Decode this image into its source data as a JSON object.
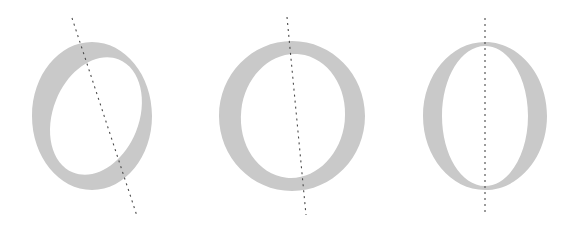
{
  "figure": {
    "background_color": "#ffffff",
    "width": 569,
    "height": 234,
    "glyph_color": "#c9c9c9",
    "axis_color": "#4a4a4a",
    "margin_guide_color": "#f4f4f4",
    "dash_pattern": "2 4",
    "axis_stroke_width": 1.1
  },
  "margin_guide": {
    "name": "left-margin-guide",
    "x": 10,
    "y_top": 8,
    "y_bottom": 228,
    "dash_pattern": "2 4",
    "color": "#f4f4f4"
  },
  "specimens": [
    {
      "id": "specimen-1",
      "letter": "O",
      "style_name": "Old Style",
      "stress": "oblique",
      "stress_angle_degrees": 22,
      "left_px": 0,
      "width_px": 190,
      "glyph": {
        "center_x": 92,
        "center_y": 116,
        "outer_rx": 60,
        "outer_ry": 74,
        "inner_rx": 43,
        "inner_ry": 61,
        "inner_offset_x": 4,
        "inner_rotation_degrees": 22,
        "bbox": {
          "x1": 32,
          "y1": 42,
          "x2": 152,
          "y2": 190
        }
      },
      "axis_line": {
        "name": "stress-axis-line",
        "x1": 72,
        "y1": 18,
        "x2": 137,
        "y2": 216
      }
    },
    {
      "id": "specimen-2",
      "letter": "O",
      "style_name": "Transitional",
      "stress": "slightly inclined",
      "stress_angle_degrees": 6,
      "left_px": 190,
      "width_px": 190,
      "glyph": {
        "center_x": 102,
        "center_y": 116,
        "outer_rx": 73,
        "outer_ry": 75,
        "inner_rx": 52,
        "inner_ry": 62,
        "inner_offset_x": 1,
        "inner_rotation_degrees": 6,
        "bbox": {
          "x1": 220,
          "y1": 41,
          "x2": 365,
          "y2": 190
        }
      },
      "axis_line": {
        "name": "stress-axis-line",
        "x1": 287,
        "y1": 17,
        "x2": 306,
        "y2": 215
      }
    },
    {
      "id": "specimen-3",
      "letter": "O",
      "style_name": "Didone",
      "stress": "vertical",
      "stress_angle_degrees": 0,
      "left_px": 380,
      "width_px": 189,
      "glyph": {
        "center_x": 105,
        "center_y": 116,
        "outer_rx": 62,
        "outer_ry": 74,
        "inner_rx": 43,
        "inner_ry": 70,
        "inner_offset_x": 0,
        "inner_rotation_degrees": 0,
        "bbox": {
          "x1": 423,
          "y1": 42,
          "x2": 547,
          "y2": 190
        }
      },
      "axis_line": {
        "name": "stress-axis-line",
        "x1": 485,
        "y1": 18,
        "x2": 485,
        "y2": 216
      }
    }
  ]
}
